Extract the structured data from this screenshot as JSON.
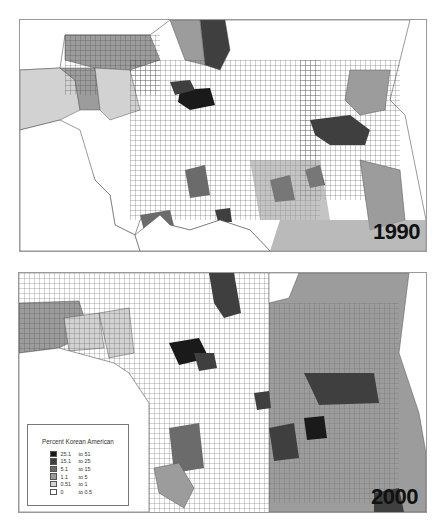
{
  "maps": [
    {
      "year": "1990"
    },
    {
      "year": "2000"
    }
  ],
  "legend": {
    "title": "Percent Korean American",
    "classes": [
      {
        "from": "25.1",
        "to": "to 51",
        "color": "#1a1a1a"
      },
      {
        "from": "15.1",
        "to": "to 25",
        "color": "#3f3f3f"
      },
      {
        "from": "5.1",
        "to": "to 15",
        "color": "#6b6b6b"
      },
      {
        "from": "1.1",
        "to": "to 5",
        "color": "#9c9c9c"
      },
      {
        "from": "0.51",
        "to": "to 1",
        "color": "#d2d2d2"
      },
      {
        "from": "0",
        "to": "to 0.5",
        "color": "#ffffff"
      }
    ]
  }
}
